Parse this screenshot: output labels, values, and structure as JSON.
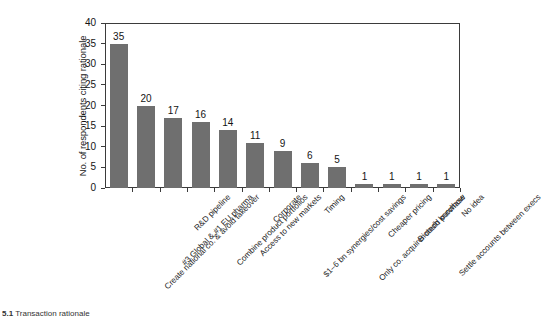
{
  "chart_data": {
    "type": "bar",
    "title": "",
    "xlabel": "",
    "ylabel": "No. of respondents citing rationale",
    "ylim": [
      0,
      40
    ],
    "ytick_values": [
      0,
      5,
      10,
      15,
      20,
      25,
      30,
      35,
      40
    ],
    "ytick_labels": [
      "0",
      "5",
      "10",
      "15",
      "20",
      "25",
      "30",
      "35",
      "40"
    ],
    "grid": false,
    "legend": null,
    "bar_color": "#6f6f6f",
    "categories": [
      "Create national co. & avoid takeover",
      "#3 Global & #1 EU pharma",
      "R&D pipeline",
      "Combine product portfolios",
      "Access to new markets",
      "Corporate",
      "$1–6 bn synergies/cost savings",
      "Timing",
      "Only co. acquirer could purchase",
      "Cheaper pricing",
      "Biotech knowhow",
      "Settle accounts between execs",
      "No idea"
    ],
    "values": [
      35,
      20,
      17,
      16,
      14,
      11,
      9,
      6,
      5,
      1,
      1,
      1,
      1
    ],
    "value_labels": [
      "35",
      "20",
      "17",
      "16",
      "14",
      "11",
      "9",
      "6",
      "5",
      "1",
      "1",
      "1",
      "1"
    ]
  },
  "caption": {
    "number": "5.1",
    "text": "Transaction rationale"
  }
}
